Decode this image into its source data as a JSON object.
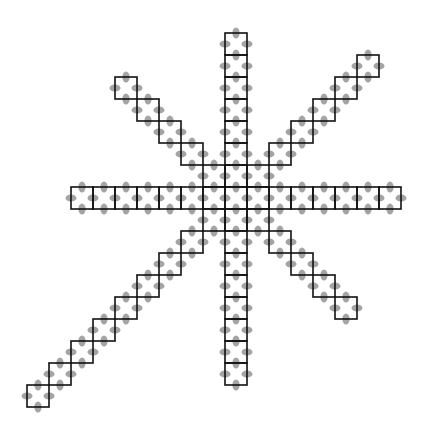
{
  "diagram": {
    "title": "",
    "colors": {
      "background": "#ffffff",
      "cell_stroke": "#111111",
      "dot_fill": "#9a9a9a"
    },
    "cell_size": 22,
    "center_cell": {
      "x": 225,
      "y": 187
    },
    "arms": [
      {
        "name": "up",
        "dx": 0,
        "dy": -1,
        "cells": 7
      },
      {
        "name": "down",
        "dx": 0,
        "dy": 1,
        "cells": 8
      },
      {
        "name": "left",
        "dx": -1,
        "dy": 0,
        "cells": 7
      },
      {
        "name": "right",
        "dx": 1,
        "dy": 0,
        "cells": 7
      },
      {
        "name": "up-left",
        "dx": -1,
        "dy": -1,
        "cells": 5
      },
      {
        "name": "up-right",
        "dx": 1,
        "dy": -1,
        "cells": 6
      },
      {
        "name": "down-left",
        "dx": -1,
        "dy": 1,
        "cells": 9
      },
      {
        "name": "down-right",
        "dx": 1,
        "dy": 1,
        "cells": 5
      }
    ],
    "dot": {
      "long_radius": 5.5,
      "short_radius": 3.6
    }
  }
}
